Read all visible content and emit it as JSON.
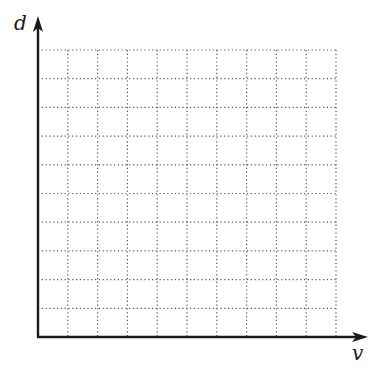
{
  "chart_data": {
    "type": "line",
    "title": "",
    "xlabel": "v",
    "ylabel": "d",
    "series": [],
    "grid": true,
    "grid_style": "dotted",
    "grid_columns": 10,
    "grid_rows": 10,
    "ticks": {
      "x": [],
      "y": []
    },
    "legend": null
  },
  "axes": {
    "x_label": "v",
    "y_label": "d"
  },
  "colors": {
    "axis": "#1a1a1a",
    "grid": "#555555",
    "background": "#ffffff"
  }
}
